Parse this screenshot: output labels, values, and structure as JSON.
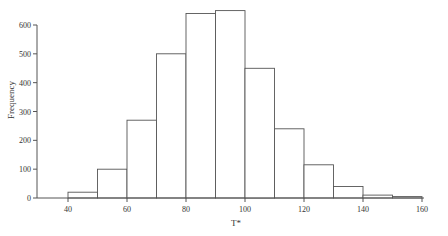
{
  "chart_data": {
    "type": "bar",
    "subtype": "histogram",
    "title": "",
    "xlabel": "T*",
    "ylabel": "Frequency",
    "bin_edges": [
      40,
      50,
      60,
      70,
      80,
      90,
      100,
      110,
      120,
      130,
      140,
      150,
      160
    ],
    "categories": [
      "40-50",
      "50-60",
      "60-70",
      "70-80",
      "80-90",
      "90-100",
      "100-110",
      "110-120",
      "120-130",
      "130-140",
      "140-150",
      "150-160"
    ],
    "values": [
      20,
      100,
      270,
      500,
      640,
      650,
      450,
      240,
      115,
      40,
      10,
      5
    ],
    "xlim": [
      40,
      160
    ],
    "ylim": [
      0,
      600
    ],
    "xticks": [
      40,
      60,
      80,
      100,
      120,
      140,
      160
    ],
    "yticks": [
      0,
      100,
      200,
      300,
      400,
      500,
      600
    ],
    "grid": false,
    "legend": null,
    "colors": {
      "bar_fill": "#ffffff",
      "bar_edge": "#555555",
      "axis": "#555555",
      "text": "#333333"
    }
  }
}
